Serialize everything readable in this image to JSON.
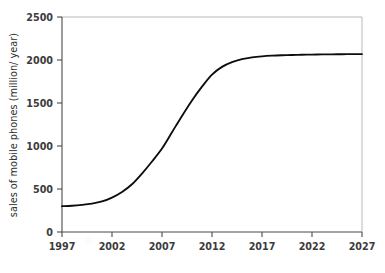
{
  "chart_data": {
    "type": "line",
    "title": "",
    "xlabel": "",
    "ylabel": "sales of mobile phones (million/ year)",
    "xlim": [
      1997,
      2027
    ],
    "ylim": [
      0,
      2500
    ],
    "grid": false,
    "legend": null,
    "x_ticks": [
      "1997",
      "2002",
      "2007",
      "2012",
      "2017",
      "2022",
      "2027"
    ],
    "x_tick_values": [
      1997,
      2002,
      2007,
      2012,
      2017,
      2022,
      2027
    ],
    "y_ticks": [
      "0",
      "500",
      "1000",
      "1500",
      "2000",
      "2500"
    ],
    "y_tick_values": [
      0,
      500,
      1000,
      1500,
      2000,
      2500
    ],
    "series": [
      {
        "name": "sales of mobile phones",
        "color": "#0d0d0f",
        "x": [
          1997,
          1998,
          1999,
          2000,
          2001,
          2002,
          2003,
          2004,
          2005,
          2006,
          2007,
          2008,
          2009,
          2010,
          2011,
          2012,
          2013,
          2014,
          2015,
          2016,
          2017,
          2018,
          2019,
          2020,
          2021,
          2022,
          2023,
          2024,
          2025,
          2026,
          2027
        ],
        "values": [
          300,
          305,
          315,
          330,
          355,
          400,
          465,
          555,
          680,
          820,
          970,
          1160,
          1350,
          1530,
          1690,
          1830,
          1920,
          1975,
          2010,
          2030,
          2042,
          2050,
          2055,
          2058,
          2061,
          2063,
          2065,
          2066,
          2067,
          2068,
          2069
        ]
      }
    ],
    "annotations": []
  },
  "axes": {
    "y_axis_label": "sales of mobile phones (million/ year)"
  }
}
